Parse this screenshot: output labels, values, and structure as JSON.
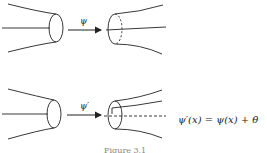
{
  "figure": {
    "top_map_label": "ψ",
    "bottom_map_label": "ψ′",
    "equation": "ψ′(x) = ψ(x) + θ",
    "caption": "Figure 3.1"
  }
}
